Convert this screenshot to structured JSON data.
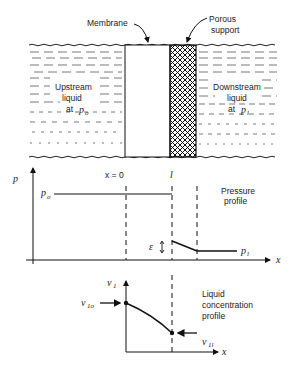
{
  "diagram": {
    "top_panel": {
      "membrane_label": "Membrane",
      "support_label_1": "Porous",
      "support_label_2": "support",
      "upstream_1": "Upstream",
      "upstream_2": "liquid",
      "upstream_3": "at",
      "upstream_p": "p",
      "upstream_sub": "o",
      "downstream_1": "Downstream",
      "downstream_2": "liquid",
      "downstream_3": "at",
      "downstream_p": "p",
      "downstream_sub": "l"
    },
    "pressure_plot": {
      "y_axis_label": "p",
      "x_axis_label": "x",
      "x0_label": "x = 0",
      "l_label": "l",
      "po_label": "p",
      "po_sub": "o",
      "pl_label": "p",
      "pl_sub": "l",
      "epsilon_label": "ε",
      "title_1": "Pressure",
      "title_2": "profile"
    },
    "concentration_plot": {
      "y_axis_label": "v",
      "y_axis_sub": "1",
      "x_axis_label": "x",
      "v1o_label": "v",
      "v1o_sub": "1o",
      "v1l_label": "v",
      "v1l_sub": "1l",
      "title_1": "Liquid",
      "title_2": "concentration",
      "title_3": "profile"
    }
  }
}
